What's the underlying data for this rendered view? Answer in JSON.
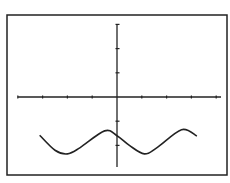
{
  "chart_data": {
    "type": "line",
    "title": "",
    "xlabel": "",
    "ylabel": "",
    "grid": false,
    "legend": null,
    "xlim": [
      -4,
      4
    ],
    "ylim": [
      -3,
      3
    ],
    "x_ticks": [
      -4,
      -3,
      -2,
      -1,
      1,
      2,
      3,
      4
    ],
    "y_ticks": [
      3,
      2,
      1,
      -1,
      -2
    ],
    "series": [
      {
        "name": "curve",
        "x": [
          -3.1,
          -2.5,
          -2.0,
          -1.5,
          -0.5,
          0.0,
          0.5,
          1.1,
          1.6,
          2.6,
          3.2
        ],
        "y": [
          -1.6,
          -2.2,
          -2.35,
          -2.1,
          -1.4,
          -1.6,
          -2.0,
          -2.35,
          -2.1,
          -1.35,
          -1.6
        ]
      }
    ]
  },
  "colors": {
    "background": "#ffffff",
    "frame": "#222222",
    "axes": "#222222",
    "curve": "#222222"
  }
}
